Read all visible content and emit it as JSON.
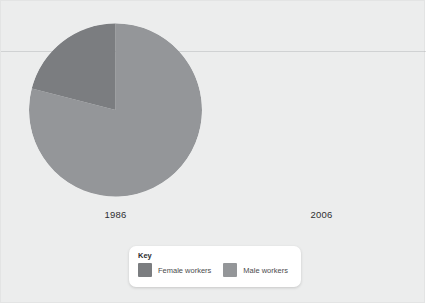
{
  "figure": {
    "background_color": "#eceded",
    "border_color": "#e3e4e4"
  },
  "years": {
    "left": "1986",
    "right": "2006"
  },
  "legend": {
    "title": "Key",
    "items": [
      {
        "label": "Female workers",
        "color": "#7b7d80"
      },
      {
        "label": "Male workers",
        "color": "#949699"
      }
    ]
  },
  "chart_data": {
    "type": "pie",
    "title": "",
    "subtitle": "",
    "xlabel": "",
    "ylabel": "",
    "grid": false,
    "legend_position": "bottom-center",
    "panels": [
      {
        "name": "1986",
        "rendered": true,
        "categories": [
          "Female workers",
          "Male workers"
        ],
        "values": [
          21,
          79
        ],
        "unit": "percent",
        "colors": [
          "#7b7d80",
          "#949699"
        ],
        "start_angle_deg": 0,
        "direction": "counterclockwise",
        "center": [
          114,
          109
        ],
        "radius": 87
      },
      {
        "name": "2006",
        "rendered": false,
        "categories": [
          "Female workers",
          "Male workers"
        ],
        "values": [],
        "unit": "percent",
        "colors": [
          "#7b7d80",
          "#949699"
        ]
      }
    ]
  }
}
